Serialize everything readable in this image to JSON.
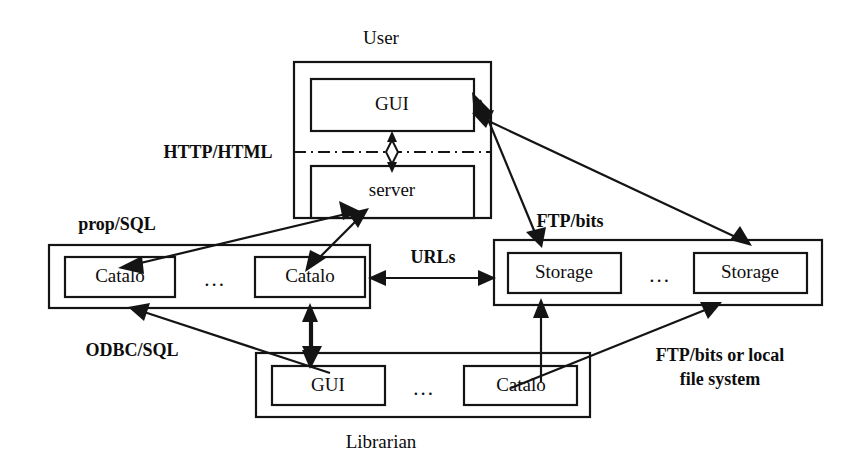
{
  "diagram": {
    "accent_color": "#141414",
    "background_color": "#ffffff",
    "groups": [
      {
        "id": "user",
        "title": "User",
        "title_position": "top",
        "nodes": [
          {
            "id": "user-gui",
            "label": "GUI"
          },
          {
            "id": "user-server",
            "label": "server"
          }
        ],
        "separator": "dash-dot"
      },
      {
        "id": "catalog-tier",
        "title": "",
        "nodes": [
          {
            "id": "catalog-left",
            "label": "Catalo"
          },
          {
            "id": "catalog-right",
            "label": "Catalo"
          }
        ],
        "ellipsis": "..."
      },
      {
        "id": "storage-tier",
        "title": "",
        "nodes": [
          {
            "id": "storage-left",
            "label": "Storage"
          },
          {
            "id": "storage-right",
            "label": "Storage"
          }
        ],
        "ellipsis": "..."
      },
      {
        "id": "librarian",
        "title": "Librarian",
        "title_position": "bottom",
        "nodes": [
          {
            "id": "librarian-gui",
            "label": "GUI"
          },
          {
            "id": "librarian-catalog",
            "label": "Catalo"
          }
        ],
        "ellipsis": "..."
      }
    ],
    "edge_labels": [
      {
        "id": "http-html",
        "text": "HTTP/HTML"
      },
      {
        "id": "prop-sql",
        "text": "prop/SQL"
      },
      {
        "id": "odbc-sql",
        "text": "ODBC/SQL"
      },
      {
        "id": "urls",
        "text": "URLs"
      },
      {
        "id": "ftp-bits",
        "text": "FTP/bits"
      },
      {
        "id": "ftp-bits-local-line1",
        "text": "FTP/bits or local"
      },
      {
        "id": "ftp-bits-local-line2",
        "text": "file system"
      }
    ]
  }
}
